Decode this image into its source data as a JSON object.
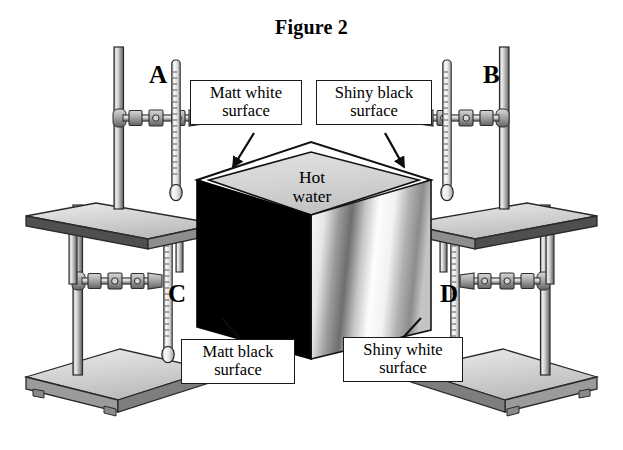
{
  "figure": {
    "title": "Figure 2",
    "background_color": "#ffffff",
    "ink_color": "#000000"
  },
  "cube": {
    "name": "Leslie's cube",
    "contents_line1": "Hot",
    "contents_line2": "water",
    "top_face_color": "#d8d8d8",
    "left_face_color": "#000000",
    "right_face_color": "#f2f2f2",
    "edge_color": "#111111"
  },
  "callouts": [
    {
      "id": "matt-white",
      "line1": "Matt white",
      "line2": "surface",
      "position": "top-left",
      "arrow": "points down-right to cube top-left edge"
    },
    {
      "id": "shiny-black",
      "line1": "Shiny black",
      "line2": "surface",
      "position": "top-right",
      "arrow": "points down-right to cube top-right edge"
    },
    {
      "id": "matt-black",
      "line1": "Matt black",
      "line2": "surface",
      "position": "bottom-left",
      "arrow": "points to cube left face"
    },
    {
      "id": "shiny-white",
      "line1": "Shiny white",
      "line2": "surface",
      "position": "bottom-right",
      "arrow": "points to cube right face"
    }
  ],
  "stands": [
    {
      "id": "A",
      "label": "A",
      "position": "upper-left",
      "mounted_on": "raised platform",
      "apparatus": "retort stand with boss clamp holding a thermometer"
    },
    {
      "id": "B",
      "label": "B",
      "position": "upper-right",
      "mounted_on": "raised platform",
      "apparatus": "retort stand with boss clamp holding a thermometer"
    },
    {
      "id": "C",
      "label": "C",
      "position": "lower-left",
      "mounted_on": "floor base plate",
      "apparatus": "retort stand with boss clamp holding a thermometer"
    },
    {
      "id": "D",
      "label": "D",
      "position": "lower-right",
      "mounted_on": "floor base plate",
      "apparatus": "retort stand with boss clamp holding a thermometer"
    }
  ],
  "colors": {
    "metal_light": "#e3e3e3",
    "metal_mid": "#b5b5b5",
    "metal_dark": "#7d7d7d",
    "metal_shadow": "#4a4a4a",
    "outline": "#1a1a1a"
  }
}
